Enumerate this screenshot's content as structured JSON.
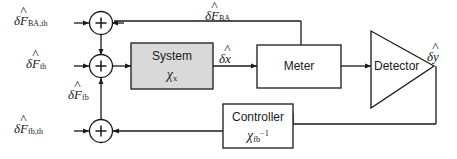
{
  "diagram": {
    "colors": {
      "line": "#1a1a1a",
      "system_box_fill": "#d9d9d9",
      "box_fill": "#ffffff",
      "text": "#1a1a1a"
    },
    "inputs": [
      {
        "name": "input-ba-th",
        "symbol_delta": "δ",
        "symbol_base": "F",
        "subscript": "BA,th",
        "full": "δF̂_BA,th"
      },
      {
        "name": "input-th",
        "symbol_delta": "δ",
        "symbol_base": "F",
        "subscript": "th",
        "full": "δF̂_th"
      },
      {
        "name": "input-fb-th",
        "symbol_delta": "δ",
        "symbol_base": "F",
        "subscript": "fb,th",
        "full": "δF̂_fb,th"
      }
    ],
    "signals": [
      {
        "name": "signal-ba-feedback",
        "symbol_delta": "δ",
        "symbol_base": "F",
        "subscript": "BA",
        "full": "δF̂_BA"
      },
      {
        "name": "signal-fb",
        "symbol_delta": "δ",
        "symbol_base": "F",
        "subscript": "fb",
        "full": "δF̂_fb"
      },
      {
        "name": "signal-x",
        "symbol_delta": "δ",
        "symbol_base": "x",
        "subscript": "",
        "full": "δx̂"
      },
      {
        "name": "signal-y",
        "symbol_delta": "δ",
        "symbol_base": "y",
        "subscript": "",
        "full": "δŷ"
      }
    ],
    "blocks": [
      {
        "name": "system-block",
        "label": "System",
        "math_base": "χ",
        "math_sub": "x",
        "math_sup": ""
      },
      {
        "name": "meter-block",
        "label": "Meter",
        "math_base": "",
        "math_sub": "",
        "math_sup": ""
      },
      {
        "name": "detector-block",
        "label": "Detector",
        "math_base": "",
        "math_sub": "",
        "math_sup": ""
      },
      {
        "name": "controller-block",
        "label": "Controller",
        "math_base": "χ",
        "math_sub": "fb",
        "math_sup": "−1"
      }
    ],
    "summing_junctions": [
      {
        "name": "summing-junction-top",
        "operator": "+"
      },
      {
        "name": "summing-junction-middle",
        "operator": "+"
      },
      {
        "name": "summing-junction-bottom",
        "operator": "+"
      }
    ]
  }
}
